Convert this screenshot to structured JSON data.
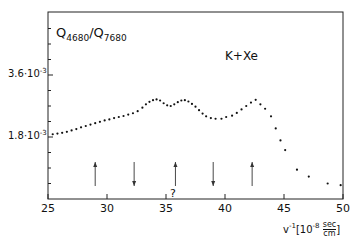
{
  "chart_data": {
    "type": "scatter",
    "title": "",
    "ylabel_main": "Q",
    "ylabel_sub1": "4680",
    "ylabel_sep": "/Q",
    "ylabel_sub2": "7680",
    "ylabel": "Q4680/Q7680",
    "xlabel": "v^-1 [10^-8 sec/cm]",
    "xlabel_parts": {
      "v": "v",
      "exp": "-1",
      "bracket_open": "[10",
      "pow": "-8",
      "num": "sec",
      "den": "cm",
      "bracket_close": "]"
    },
    "annotation": "K+Xe",
    "question_mark": "?",
    "xlim": [
      25,
      50
    ],
    "ylim_units": "1e-3",
    "ylim": [
      0,
      5.0
    ],
    "x_ticks": [
      25,
      30,
      35,
      40,
      45,
      50
    ],
    "x_tick_labels": [
      "25",
      "30",
      "35",
      "40",
      "45",
      "50"
    ],
    "y_ticks": [
      1.8,
      3.6
    ],
    "y_tick_labels": [
      "1.8·10",
      "3.6·10"
    ],
    "y_tick_exp": "-3",
    "grid": false,
    "series": [
      {
        "name": "K+Xe",
        "x": [
          25.4,
          25.8,
          26.2,
          26.6,
          27.0,
          27.4,
          27.8,
          28.2,
          28.6,
          29.0,
          29.4,
          29.8,
          30.2,
          30.6,
          31.0,
          31.4,
          31.8,
          32.2,
          32.6,
          33.0,
          33.3,
          33.6,
          33.9,
          34.2,
          34.5,
          34.8,
          35.1,
          35.4,
          35.7,
          36.0,
          36.3,
          36.6,
          36.9,
          37.2,
          37.5,
          37.8,
          38.1,
          38.4,
          38.8,
          39.2,
          39.7,
          40.1,
          40.6,
          41.0,
          41.4,
          41.8,
          42.2,
          42.6,
          43.0,
          43.4,
          43.9,
          44.3,
          44.7,
          45.1,
          46.1,
          47.1,
          48.7,
          49.8
        ],
        "values": [
          1.88,
          1.9,
          1.92,
          1.95,
          1.99,
          2.03,
          2.08,
          2.12,
          2.16,
          2.2,
          2.24,
          2.28,
          2.31,
          2.35,
          2.38,
          2.41,
          2.45,
          2.49,
          2.55,
          2.65,
          2.75,
          2.82,
          2.87,
          2.89,
          2.86,
          2.78,
          2.72,
          2.7,
          2.75,
          2.81,
          2.86,
          2.87,
          2.83,
          2.76,
          2.68,
          2.58,
          2.48,
          2.4,
          2.35,
          2.33,
          2.33,
          2.38,
          2.42,
          2.5,
          2.6,
          2.7,
          2.8,
          2.88,
          2.75,
          2.62,
          2.4,
          2.05,
          1.7,
          1.42,
          0.85,
          0.65,
          0.45,
          0.4
        ]
      }
    ],
    "arrows": [
      {
        "x": 29.0,
        "direction": "up"
      },
      {
        "x": 32.3,
        "direction": "down"
      },
      {
        "x": 35.8,
        "direction": "up",
        "label": "?"
      },
      {
        "x": 39.0,
        "direction": "down"
      },
      {
        "x": 42.3,
        "direction": "up"
      }
    ]
  }
}
